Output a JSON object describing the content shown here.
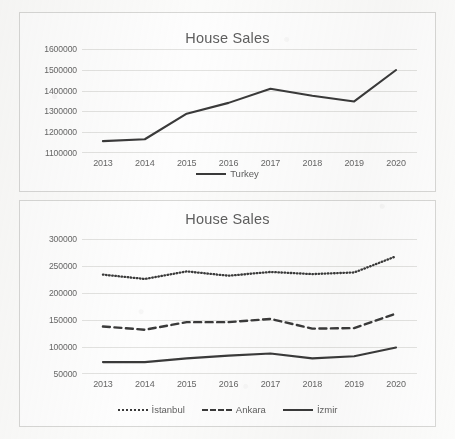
{
  "charts": [
    {
      "id": "chart-top",
      "title": "House Sales",
      "legend_position": "bottom"
    },
    {
      "id": "chart-bottom",
      "title": "House Sales",
      "legend_position": "bottom"
    }
  ],
  "chart_data": [
    {
      "type": "line",
      "title": "House Sales",
      "xlabel": "",
      "ylabel": "",
      "categories": [
        "2013",
        "2014",
        "2015",
        "2016",
        "2017",
        "2018",
        "2019",
        "2020"
      ],
      "ylim": [
        1100000,
        1600000
      ],
      "yticks": [
        1100000,
        1200000,
        1300000,
        1400000,
        1500000,
        1600000
      ],
      "ytick_labels": [
        "1100000",
        "1200000",
        "1300000",
        "1400000",
        "1500000",
        "1600000"
      ],
      "grid": true,
      "legend": "bottom",
      "series": [
        {
          "name": "Turkey",
          "style": "solid",
          "color": "#3a3a3a",
          "values": [
            1157000,
            1166000,
            1289000,
            1341000,
            1409000,
            1375000,
            1348000,
            1499000
          ]
        }
      ]
    },
    {
      "type": "line",
      "title": "House Sales",
      "xlabel": "",
      "ylabel": "",
      "categories": [
        "2013",
        "2014",
        "2015",
        "2016",
        "2017",
        "2018",
        "2019",
        "2020"
      ],
      "ylim": [
        50000,
        300000
      ],
      "yticks": [
        50000,
        100000,
        150000,
        200000,
        250000,
        300000
      ],
      "ytick_labels": [
        "50000",
        "100000",
        "150000",
        "200000",
        "250000",
        "300000"
      ],
      "grid": true,
      "legend": "bottom",
      "series": [
        {
          "name": "İstanbul",
          "style": "dotted",
          "color": "#3a3a3a",
          "values": [
            234000,
            226000,
            240000,
            232000,
            239000,
            235000,
            238000,
            268000
          ]
        },
        {
          "name": "Ankara",
          "style": "dashed",
          "color": "#3a3a3a",
          "values": [
            138000,
            132000,
            146000,
            146000,
            152000,
            134000,
            135000,
            162000
          ]
        },
        {
          "name": "İzmir",
          "style": "solid",
          "color": "#3a3a3a",
          "values": [
            72000,
            72000,
            79000,
            84000,
            88000,
            79000,
            83000,
            99000
          ]
        }
      ]
    }
  ]
}
